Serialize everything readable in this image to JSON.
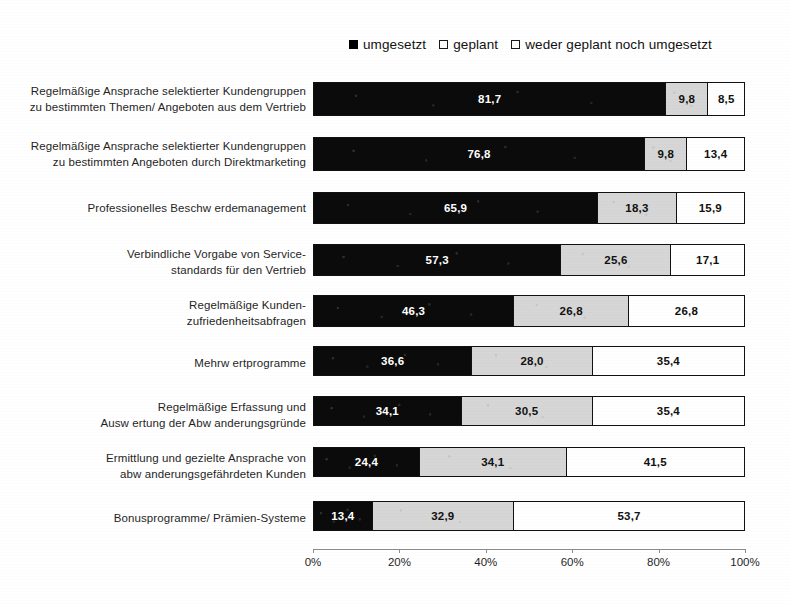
{
  "chart_data": {
    "type": "bar",
    "orientation": "horizontal",
    "stacked": true,
    "normalized": "100%",
    "title": "",
    "subtitle": "",
    "xlabel": "",
    "ylabel": "",
    "xlim": [
      0,
      100
    ],
    "xticks": [
      "0%",
      "20%",
      "40%",
      "60%",
      "80%",
      "100%"
    ],
    "xtick_values": [
      0,
      20,
      40,
      60,
      80,
      100
    ],
    "grid": false,
    "legend_position": "top",
    "categories": [
      "Regelmäßige Ansprache selektierter Kundengruppen zu bestimmten Themen/ Angeboten aus dem Vertrieb",
      "Regelmäßige Ansprache selektierter Kundengruppen zu bestimmten Angeboten durch Direktmarketing",
      "Professionelles Beschw erdemanagement",
      "Verbindliche Vorgabe von Service- standards für den Vertrieb",
      "Regelmäßige Kunden- zufriedenheitsabfragen",
      "Mehrw ertprogramme",
      "Regelmäßige Erfassung und Ausw ertung der Abw anderungsgründe",
      "Ermittlung und gezielte Ansprache von abw anderungsgefährdeten Kunden",
      "Bonusprogramme/ Prämien-Systeme"
    ],
    "category_lines": [
      [
        "Regelmäßige Ansprache selektierter Kundengruppen",
        "zu bestimmten Themen/ Angeboten aus dem Vertrieb"
      ],
      [
        "Regelmäßige Ansprache selektierter Kundengruppen",
        "zu bestimmten Angeboten durch Direktmarketing"
      ],
      [
        "Professionelles Beschw erdemanagement"
      ],
      [
        "Verbindliche Vorgabe von Service-",
        "standards für den Vertrieb"
      ],
      [
        "Regelmäßige Kunden-",
        "zufriedenheitsabfragen"
      ],
      [
        "Mehrw ertprogramme"
      ],
      [
        "Regelmäßige Erfassung und",
        "Ausw ertung der Abw anderungsgründe"
      ],
      [
        "Ermittlung und gezielte Ansprache von",
        "abw anderungsgefährdeten Kunden"
      ],
      [
        "Bonusprogramme/ Prämien-Systeme"
      ]
    ],
    "series": [
      {
        "name": "umgesetzt",
        "color": "#000000",
        "values": [
          81.7,
          76.8,
          65.9,
          57.3,
          46.3,
          36.6,
          34.1,
          24.4,
          13.4
        ],
        "labels": [
          "81,7",
          "76,8",
          "65,9",
          "57,3",
          "46,3",
          "36,6",
          "34,1",
          "24,4",
          "13,4"
        ]
      },
      {
        "name": "geplant",
        "color": "#d6d6d6",
        "values": [
          9.8,
          9.8,
          18.3,
          25.6,
          26.8,
          28.0,
          30.5,
          34.1,
          32.9
        ],
        "labels": [
          "9,8",
          "9,8",
          "18,3",
          "25,6",
          "26,8",
          "28,0",
          "30,5",
          "34,1",
          "32,9"
        ]
      },
      {
        "name": "weder geplant noch umgesetzt",
        "color": "#ffffff",
        "values": [
          8.5,
          13.4,
          15.9,
          17.1,
          26.8,
          35.4,
          35.4,
          41.5,
          53.7
        ],
        "labels": [
          "8,5",
          "13,4",
          "15,9",
          "17,1",
          "26,8",
          "35,4",
          "35,4",
          "41,5",
          "53,7"
        ]
      }
    ]
  },
  "legend": {
    "items": [
      {
        "label": "umgesetzt",
        "marker": "filled-square-icon"
      },
      {
        "label": "geplant",
        "marker": "hollow-square-icon"
      },
      {
        "label": "weder geplant noch umgesetzt",
        "marker": "hollow-square-icon"
      }
    ]
  }
}
